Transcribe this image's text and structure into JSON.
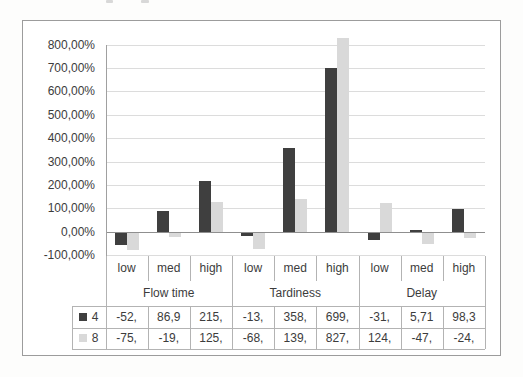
{
  "chart_data": {
    "type": "bar",
    "title": "",
    "grid": true,
    "legend_position": "data-table-left",
    "y_axis": {
      "unit": "percent",
      "min": -100,
      "max": 800,
      "tick_step": 100,
      "tick_values": [
        800,
        700,
        600,
        500,
        400,
        300,
        200,
        100,
        0,
        -100
      ],
      "tick_labels": [
        "800,00%",
        "700,00%",
        "600,00%",
        "500,00%",
        "400,00%",
        "300,00%",
        "200,00%",
        "100,00%",
        "0,00%",
        "-100,00%"
      ]
    },
    "x_axis": {
      "groups": [
        {
          "label": "Flow time",
          "categories": [
            "low",
            "med",
            "high"
          ]
        },
        {
          "label": "Tardiness",
          "categories": [
            "low",
            "med",
            "high"
          ]
        },
        {
          "label": "Delay",
          "categories": [
            "low",
            "med",
            "high"
          ]
        }
      ]
    },
    "series": [
      {
        "name": "4",
        "color": "#3f3f3f",
        "values": [
          -52,
          86.9,
          215,
          -13,
          358,
          699,
          -31,
          5.71,
          98.3
        ],
        "table_labels": [
          "-52,",
          "86,9",
          "215,",
          "-13,",
          "358,",
          "699,",
          "-31,",
          "5,71",
          "98,3"
        ]
      },
      {
        "name": "8",
        "color": "#d9d9d9",
        "values": [
          -75,
          -19,
          125,
          -68,
          139,
          827,
          124,
          -47,
          -24
        ],
        "table_labels": [
          "-75,",
          "-19,",
          "125,",
          "-68,",
          "139,",
          "827,",
          "124,",
          "-47,",
          "-24,"
        ]
      }
    ]
  },
  "colors": {
    "series_dark": "#3f3f3f",
    "series_light": "#d9d9d9",
    "gridline": "#dcdcdc",
    "zero_line": "#8f8f8f",
    "table_border": "#b3b3b3",
    "frame_border": "#9c9c9c",
    "text": "#3c3c3c"
  }
}
